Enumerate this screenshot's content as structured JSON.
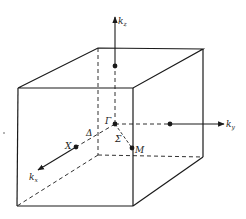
{
  "diagram": {
    "type": "brillouin-zone-simple-cubic",
    "colors": {
      "line": "#1a1a1a",
      "background": "#ffffff"
    },
    "axes": {
      "kz": {
        "label": "k",
        "subscript": "z"
      },
      "ky": {
        "label": "k",
        "subscript": "y"
      },
      "kx": {
        "label": "k",
        "subscript": "x"
      }
    },
    "points": {
      "gamma": "Γ",
      "x": "X",
      "m": "M"
    },
    "lines": {
      "delta": "Δ",
      "sigma": "Σ"
    }
  }
}
